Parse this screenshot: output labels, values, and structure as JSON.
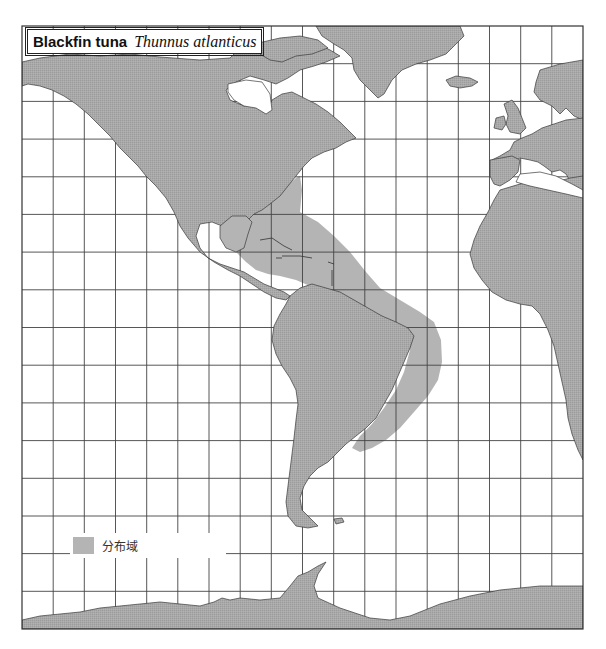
{
  "title": {
    "common_name": "Blackfin tuna",
    "scientific_name": "Thunnus atlanticus"
  },
  "legend": {
    "items": [
      {
        "label": "分布域",
        "color": "#b4b4b4",
        "meaning": "distribution-range"
      }
    ]
  },
  "colors": {
    "land": "#a9a9a9",
    "distribution": "#b4b4b4",
    "ocean": "#ffffff",
    "grid": "#333333",
    "coastline": "#3a3a3a"
  },
  "map": {
    "projection": "mercator",
    "region": "Atlantic Ocean & Americas",
    "frame": {
      "left": 22,
      "top": 26,
      "right": 583,
      "bottom": 629
    },
    "grid": {
      "columns": 18,
      "rows": 16
    },
    "landmasses": [
      "North America",
      "Greenland",
      "Iceland",
      "Europe",
      "Africa",
      "South America",
      "Antarctica"
    ]
  }
}
